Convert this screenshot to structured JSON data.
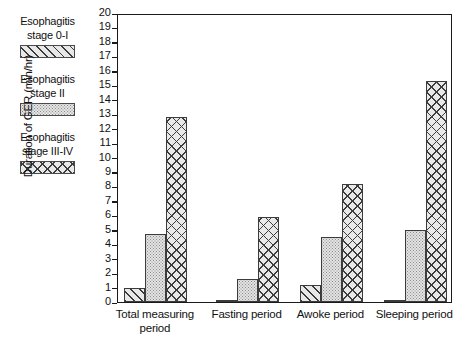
{
  "chart_data": {
    "type": "bar",
    "title": "",
    "xlabel": "",
    "ylabel": "Duration of GER (min/hr)",
    "ylim": [
      0,
      20
    ],
    "ytick_step": 1,
    "yticks": [
      20,
      19,
      18,
      17,
      16,
      15,
      14,
      13,
      12,
      11,
      10,
      9,
      8,
      7,
      6,
      5,
      4,
      3,
      2,
      1,
      0
    ],
    "grid": false,
    "legend_position": "left-outside",
    "categories": [
      "Total measuring period",
      "Fasting period",
      "Awoke period",
      "Sleeping period"
    ],
    "series": [
      {
        "name": "Esophagitis stage 0-I",
        "pattern": "diagonal-hatch",
        "values": [
          1.0,
          0.1,
          1.2,
          0.15
        ]
      },
      {
        "name": "Esophagitis stage II",
        "pattern": "stipple-dots",
        "values": [
          4.7,
          1.6,
          4.5,
          5.0
        ]
      },
      {
        "name": "Esophagitis stage III-IV",
        "pattern": "cross-hatch",
        "values": [
          12.8,
          5.9,
          8.2,
          15.3
        ]
      }
    ]
  },
  "legend": {
    "entries": [
      {
        "line1": "Esophagitis",
        "line2": "stage 0-I",
        "pattern": "diagonal-hatch"
      },
      {
        "line1": "Esophagitis",
        "line2": "stage II",
        "pattern": "stipple-dots"
      },
      {
        "line1": "Esophagitis",
        "line2": "stage III-IV",
        "pattern": "cross-hatch"
      }
    ]
  },
  "axis": {
    "y_title": "Duration of GER (min/hr)",
    "x_categories": [
      {
        "line1": "Total measuring",
        "line2": "period"
      },
      {
        "line1": "Fasting period",
        "line2": ""
      },
      {
        "line1": "Awoke period",
        "line2": ""
      },
      {
        "line1": "Sleeping period",
        "line2": ""
      }
    ]
  },
  "colors": {
    "frame": "#1a1a1a",
    "bar_outline": "#3c3c3c",
    "pattern_ink": "#3a3a3a",
    "fill_light": "#e8e8e8",
    "background": "#ffffff"
  }
}
